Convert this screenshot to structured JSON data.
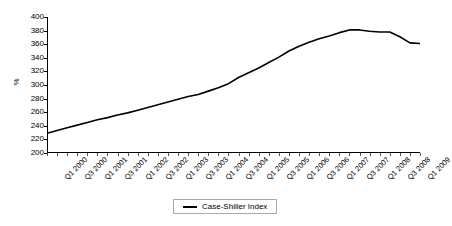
{
  "chart_data": {
    "type": "line",
    "title": "",
    "xlabel": "",
    "ylabel": "%",
    "ylim": [
      200,
      400
    ],
    "yticks": [
      200,
      220,
      240,
      260,
      280,
      300,
      320,
      340,
      360,
      380,
      400
    ],
    "grid": false,
    "legend_position": "bottom-center",
    "legend": [
      "Case-Shiller Index"
    ],
    "line_color": "#000000",
    "categories": [
      "Q1 2000",
      "Q2 2000",
      "Q3 2000",
      "Q4 2000",
      "Q1 2001",
      "Q2 2001",
      "Q3 2001",
      "Q4 2001",
      "Q1 2002",
      "Q2 2002",
      "Q3 2002",
      "Q4 2002",
      "Q1 2003",
      "Q2 2003",
      "Q3 2003",
      "Q4 2003",
      "Q1 2004",
      "Q2 2004",
      "Q3 2004",
      "Q4 2004",
      "Q1 2005",
      "Q2 2005",
      "Q3 2005",
      "Q4 2005",
      "Q1 2006",
      "Q2 2006",
      "Q3 2006",
      "Q4 2006",
      "Q1 2007",
      "Q2 2007",
      "Q3 2007",
      "Q4 2007",
      "Q1 2008",
      "Q2 2008",
      "Q3 2008",
      "Q4 2008",
      "Q1 2009",
      "Q2 2009"
    ],
    "tick_labels_shown": [
      "Q1 2000",
      "Q3 2000",
      "Q1 2001",
      "Q3 2001",
      "Q1 2002",
      "Q3 2002",
      "Q1 2003",
      "Q3 2003",
      "Q1 2004",
      "Q3 2004",
      "Q1 2005",
      "Q3 2005",
      "Q1 2006",
      "Q3 2006",
      "Q1 2007",
      "Q3 2007",
      "Q1 2008",
      "Q3 2008",
      "Q1 2009"
    ],
    "series": [
      {
        "name": "Case-Shiller Index",
        "values": [
          229,
          233,
          237,
          241,
          245,
          249,
          252,
          256,
          259,
          263,
          267,
          271,
          275,
          279,
          283,
          286,
          291,
          296,
          302,
          311,
          318,
          325,
          333,
          341,
          350,
          357,
          363,
          368,
          372,
          377,
          381,
          381,
          379,
          378,
          378,
          371,
          362,
          361
        ]
      }
    ]
  }
}
